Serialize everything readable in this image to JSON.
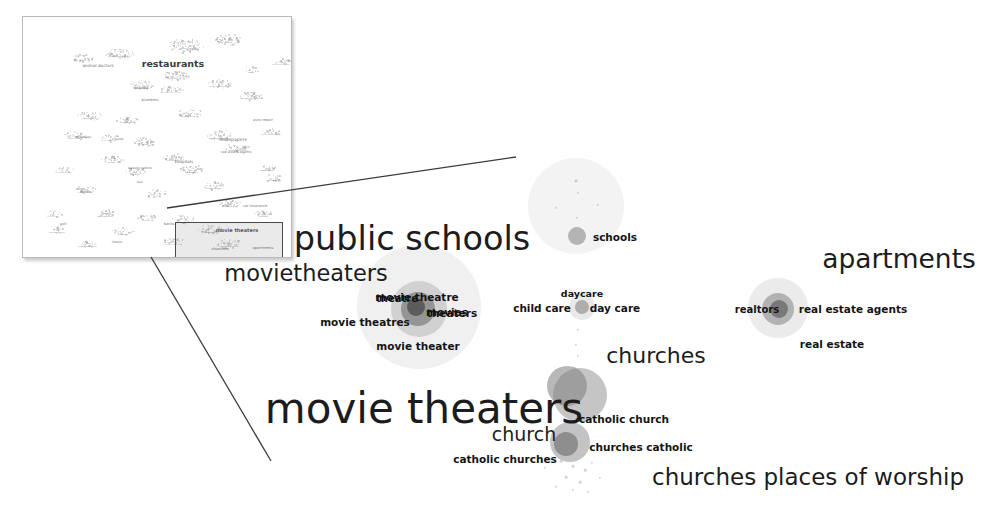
{
  "view": {
    "title": "Related search-term map — zoomed detail view",
    "background_color": "#ffffff",
    "blob_color": "#8f8f8f",
    "line_color": "#3b3b3b",
    "text_color": "#141414"
  },
  "inset": {
    "name": "overview-thumbnail",
    "border_color": "#b9b9b9",
    "labels": [
      {
        "text": "restaurants",
        "x": 150,
        "y": 46,
        "size": 9.5,
        "weight": 600,
        "color": "#3b3b3b"
      },
      {
        "text": "animal doctors",
        "x": 75,
        "y": 48,
        "size": 4.2,
        "weight": 400,
        "color": "#6e6e6e"
      },
      {
        "text": "newspapers",
        "x": 210,
        "y": 122,
        "size": 4.6,
        "weight": 400,
        "color": "#6e6e6e"
      },
      {
        "text": "hospitals",
        "x": 161,
        "y": 144,
        "size": 4.0,
        "weight": 400,
        "color": "#6e6e6e"
      },
      {
        "text": "bus",
        "x": 268,
        "y": 44,
        "size": 3.6,
        "weight": 400,
        "color": "#7a7a7a"
      },
      {
        "text": "dentists",
        "x": 118,
        "y": 70,
        "size": 3.8,
        "weight": 400,
        "color": "#7a7a7a"
      },
      {
        "text": "plumbers",
        "x": 127,
        "y": 83,
        "size": 3.6,
        "weight": 400,
        "color": "#7a7a7a"
      },
      {
        "text": "auto repair",
        "x": 240,
        "y": 103,
        "size": 3.6,
        "weight": 400,
        "color": "#7a7a7a"
      },
      {
        "text": "car insurance",
        "x": 232,
        "y": 189,
        "size": 3.6,
        "weight": 400,
        "color": "#7a7a7a"
      },
      {
        "text": "real estate agents",
        "x": 213,
        "y": 135,
        "size": 3.4,
        "weight": 400,
        "color": "#7a7a7a"
      },
      {
        "text": "beauty salons",
        "x": 117,
        "y": 151,
        "size": 3.4,
        "weight": 400,
        "color": "#7a7a7a"
      },
      {
        "text": "pizza",
        "x": 96,
        "y": 122,
        "size": 3.4,
        "weight": 400,
        "color": "#7a7a7a"
      },
      {
        "text": "attorneys",
        "x": 60,
        "y": 120,
        "size": 3.4,
        "weight": 400,
        "color": "#7a7a7a"
      },
      {
        "text": "florists",
        "x": 63,
        "y": 175,
        "size": 3.4,
        "weight": 400,
        "color": "#7a7a7a"
      },
      {
        "text": "golf",
        "x": 40,
        "y": 207,
        "size": 3.4,
        "weight": 400,
        "color": "#7a7a7a"
      },
      {
        "text": "hotels",
        "x": 94,
        "y": 225,
        "size": 3.4,
        "weight": 400,
        "color": "#7a7a7a"
      },
      {
        "text": "banks",
        "x": 146,
        "y": 207,
        "size": 3.6,
        "weight": 400,
        "color": "#7a7a7a"
      },
      {
        "text": "taxi",
        "x": 117,
        "y": 165,
        "size": 3.2,
        "weight": 400,
        "color": "#7a7a7a"
      },
      {
        "text": "movie theaters",
        "x": 214,
        "y": 213,
        "size": 5.0,
        "weight": 600,
        "color": "#4a4a4a"
      },
      {
        "text": "churches",
        "x": 197,
        "y": 231,
        "size": 3.8,
        "weight": 500,
        "color": "#5c5c5c"
      },
      {
        "text": "apartments",
        "x": 240,
        "y": 231,
        "size": 3.6,
        "weight": 400,
        "color": "#6e6e6e"
      }
    ],
    "selection_box": {
      "x": 152,
      "y": 205,
      "w": 106,
      "h": 38
    }
  },
  "detail": {
    "headline_labels": [
      {
        "text": "public schools",
        "x": 412,
        "y": 238,
        "size": 33.5,
        "weight": 400
      },
      {
        "text": "movietheaters",
        "x": 306,
        "y": 273,
        "size": 22.5,
        "weight": 400
      },
      {
        "text": "apartments",
        "x": 899,
        "y": 258,
        "size": 26.5,
        "weight": 400
      },
      {
        "text": "movie theaters",
        "x": 424,
        "y": 408,
        "size": 42.0,
        "weight": 400
      },
      {
        "text": "churches",
        "x": 656,
        "y": 355,
        "size": 22.0,
        "weight": 400
      },
      {
        "text": "churches places of worship",
        "x": 808,
        "y": 477,
        "size": 23.0,
        "weight": 400
      },
      {
        "text": "church",
        "x": 524,
        "y": 434,
        "size": 19.0,
        "weight": 400
      }
    ],
    "term_labels": [
      {
        "text": "schools",
        "x": 615,
        "y": 237,
        "size": 10.5,
        "weight": 600
      },
      {
        "text": "daycare",
        "x": 582,
        "y": 293,
        "size": 9.5,
        "weight": 600
      },
      {
        "text": "child care",
        "x": 542,
        "y": 308,
        "size": 10.5,
        "weight": 600
      },
      {
        "text": "day care",
        "x": 615,
        "y": 308,
        "size": 10.5,
        "weight": 600
      },
      {
        "text": "theatre",
        "x": 397,
        "y": 298,
        "size": 10.0,
        "weight": 600
      },
      {
        "text": "movie theatre",
        "x": 417,
        "y": 297,
        "size": 10.5,
        "weight": 600
      },
      {
        "text": "movies",
        "x": 447,
        "y": 312,
        "size": 10.5,
        "weight": 600
      },
      {
        "text": "theaters",
        "x": 452,
        "y": 313,
        "size": 10.5,
        "weight": 600
      },
      {
        "text": "movie theatres",
        "x": 365,
        "y": 322,
        "size": 10.5,
        "weight": 600
      },
      {
        "text": "movie theater",
        "x": 418,
        "y": 346,
        "size": 10.5,
        "weight": 600
      },
      {
        "text": "catholic church",
        "x": 624,
        "y": 419,
        "size": 10.5,
        "weight": 600
      },
      {
        "text": "churches catholic",
        "x": 641,
        "y": 447,
        "size": 10.5,
        "weight": 600
      },
      {
        "text": "catholic churches",
        "x": 505,
        "y": 459,
        "size": 10.5,
        "weight": 600
      },
      {
        "text": "realtors",
        "x": 757,
        "y": 309,
        "size": 10.0,
        "weight": 600
      },
      {
        "text": "real estate agents",
        "x": 853,
        "y": 309,
        "size": 10.5,
        "weight": 600
      },
      {
        "text": "real estate",
        "x": 832,
        "y": 344,
        "size": 10.5,
        "weight": 600
      }
    ],
    "blobs": [
      {
        "name": "schools-outer",
        "x": 576,
        "y": 206,
        "r": 48,
        "color": "#9a9a9a",
        "opacity": 0.12
      },
      {
        "name": "schools-core",
        "x": 577,
        "y": 236,
        "r": 9,
        "color": "#8a8a8a",
        "opacity": 0.6
      },
      {
        "name": "daycare-outer",
        "x": 582,
        "y": 307,
        "r": 13,
        "color": "#9a9a9a",
        "opacity": 0.22
      },
      {
        "name": "daycare-core",
        "x": 582,
        "y": 307,
        "r": 7,
        "color": "#878787",
        "opacity": 0.62
      },
      {
        "name": "theaters-outer",
        "x": 419,
        "y": 307,
        "r": 62,
        "color": "#9a9a9a",
        "opacity": 0.15
      },
      {
        "name": "theaters-mid",
        "x": 419,
        "y": 309,
        "r": 28,
        "color": "#8f8f8f",
        "opacity": 0.32
      },
      {
        "name": "theaters-inner",
        "x": 418,
        "y": 309,
        "r": 17,
        "color": "#6f6f6f",
        "opacity": 0.62
      },
      {
        "name": "theaters-core",
        "x": 416,
        "y": 307,
        "r": 9,
        "color": "#4d4d4d",
        "opacity": 0.8
      },
      {
        "name": "church-big",
        "x": 580,
        "y": 395,
        "r": 27,
        "color": "#8c8c8c",
        "opacity": 0.5
      },
      {
        "name": "church-upper",
        "x": 567,
        "y": 386,
        "r": 20,
        "color": "#7e7e7e",
        "opacity": 0.55
      },
      {
        "name": "church-lower",
        "x": 570,
        "y": 442,
        "r": 20,
        "color": "#8c8c8c",
        "opacity": 0.52
      },
      {
        "name": "church-lower-core",
        "x": 566,
        "y": 444,
        "r": 12,
        "color": "#6d6d6d",
        "opacity": 0.62
      },
      {
        "name": "realestate-outer",
        "x": 778,
        "y": 308,
        "r": 30,
        "color": "#9a9a9a",
        "opacity": 0.2
      },
      {
        "name": "realestate-mid",
        "x": 778,
        "y": 309,
        "r": 16,
        "color": "#7e7e7e",
        "opacity": 0.52
      },
      {
        "name": "realestate-core",
        "x": 779,
        "y": 309,
        "r": 9,
        "color": "#5e5e5e",
        "opacity": 0.68
      }
    ],
    "specks": [
      {
        "x": 576,
        "y": 181,
        "r": 1.4
      },
      {
        "x": 578,
        "y": 193,
        "r": 1.2
      },
      {
        "x": 577,
        "y": 218,
        "r": 1.2
      },
      {
        "x": 576,
        "y": 228,
        "r": 1.2
      },
      {
        "x": 556,
        "y": 208,
        "r": 1.2
      },
      {
        "x": 598,
        "y": 205,
        "r": 1.2
      },
      {
        "x": 578,
        "y": 330,
        "r": 1.2
      },
      {
        "x": 576,
        "y": 345,
        "r": 1.2
      },
      {
        "x": 578,
        "y": 356,
        "r": 1.2
      },
      {
        "x": 574,
        "y": 368,
        "r": 1.3
      },
      {
        "x": 579,
        "y": 378,
        "r": 1.2
      },
      {
        "x": 561,
        "y": 461,
        "r": 1.3
      },
      {
        "x": 573,
        "y": 466,
        "r": 1.3
      },
      {
        "x": 585,
        "y": 470,
        "r": 1.3
      },
      {
        "x": 566,
        "y": 477,
        "r": 1.3
      },
      {
        "x": 580,
        "y": 482,
        "r": 1.3
      },
      {
        "x": 592,
        "y": 463,
        "r": 1.2
      },
      {
        "x": 573,
        "y": 490,
        "r": 1.2
      },
      {
        "x": 588,
        "y": 492,
        "r": 1.2
      },
      {
        "x": 600,
        "y": 478,
        "r": 1.2
      },
      {
        "x": 556,
        "y": 487,
        "r": 1.2
      },
      {
        "x": 545,
        "y": 468,
        "r": 1.2
      }
    ]
  },
  "connectors": [
    {
      "name": "connector-top",
      "x1": 167,
      "y1": 208,
      "x2": 516,
      "y2": 157
    },
    {
      "name": "connector-bottom",
      "x1": 151,
      "y1": 257,
      "x2": 271,
      "y2": 461
    }
  ]
}
